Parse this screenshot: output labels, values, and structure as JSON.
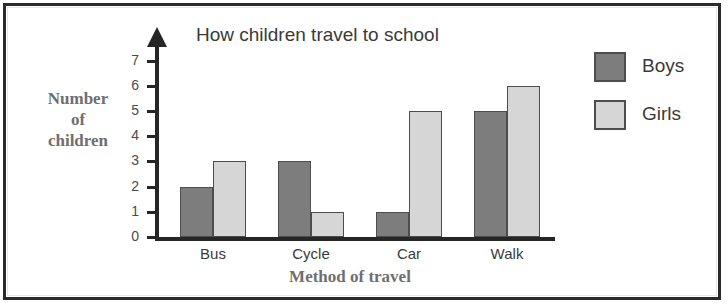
{
  "chart_data": {
    "type": "bar",
    "title": "How children travel to school",
    "xlabel": "Method of travel",
    "ylabel": "Number of children",
    "ylabel_lines": [
      "Number",
      "of",
      "children"
    ],
    "categories": [
      "Bus",
      "Cycle",
      "Car",
      "Walk"
    ],
    "series": [
      {
        "name": "Boys",
        "color": "#7d7d7d",
        "values": [
          2,
          3,
          1,
          5
        ]
      },
      {
        "name": "Girls",
        "color": "#d6d6d6",
        "values": [
          3,
          1,
          5,
          6
        ]
      }
    ],
    "ylim": [
      0,
      7
    ],
    "yticks": [
      0,
      1,
      2,
      3,
      4,
      5,
      6,
      7
    ],
    "ytick_labels": [
      "0",
      "1",
      "2",
      "3",
      "4",
      "5",
      "6",
      "7"
    ],
    "grid": false,
    "legend_position": "right",
    "axis_arrow": true
  },
  "legend": {
    "entries": [
      {
        "label": "Boys",
        "color": "#7d7d7d"
      },
      {
        "label": "Girls",
        "color": "#d6d6d6"
      }
    ]
  },
  "colors": {
    "boys": "#7d7d7d",
    "girls": "#d6d6d6",
    "axis": "#262626",
    "frame": "#2b2b2b",
    "serif_text": "#6f6f6f",
    "sans_text": "#3a3a3a"
  }
}
